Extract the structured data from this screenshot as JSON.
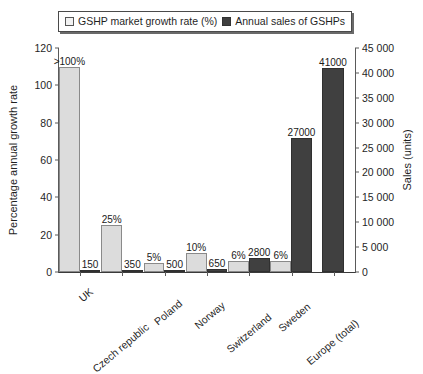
{
  "legend": {
    "entries": [
      {
        "label": "GSHP market growth rate (%)",
        "swatch": "light-square-icon"
      },
      {
        "label": "Annual sales of GSHPs",
        "swatch": "dark-square-icon"
      }
    ]
  },
  "axes": {
    "left_title": "Percentage annual growth rate",
    "right_title": "Sales (units)",
    "left_ticks": [
      "0",
      "20",
      "40",
      "60",
      "80",
      "100",
      "120"
    ],
    "right_ticks": [
      "0",
      "5 000",
      "10 000",
      "15 000",
      "20 000",
      "25 000",
      "30 000",
      "35 000",
      "40 000",
      "45 000"
    ]
  },
  "colors": {
    "growth_bar": "#dcdcdc",
    "sales_bar": "#404040",
    "axis": "#5a5a5a",
    "text": "#1f1f1f"
  },
  "chart_data": {
    "type": "bar",
    "title": "",
    "xlabel": "",
    "ylabel": "Percentage annual growth rate",
    "y2label": "Sales (units)",
    "ylim": [
      0,
      120
    ],
    "y2lim": [
      0,
      45000
    ],
    "grid": false,
    "legend_position": "top",
    "categories": [
      "UK",
      "Czech republic",
      "Poland",
      "Norway",
      "Switzerland",
      "Sweden",
      "Europe (total)"
    ],
    "series": [
      {
        "name": "GSHP market growth rate (%)",
        "axis": "left",
        "values": [
          110,
          25,
          5,
          10,
          6,
          6,
          null
        ],
        "labels": [
          ">100%",
          "25%",
          "5%",
          "10%",
          "6%",
          "6%",
          ""
        ]
      },
      {
        "name": "Annual sales of GSHPs",
        "axis": "right",
        "values": [
          150,
          350,
          500,
          650,
          2800,
          27000,
          41000
        ],
        "labels": [
          "150",
          "350",
          "500",
          "650",
          "2800",
          "27000",
          "41000"
        ]
      }
    ]
  }
}
